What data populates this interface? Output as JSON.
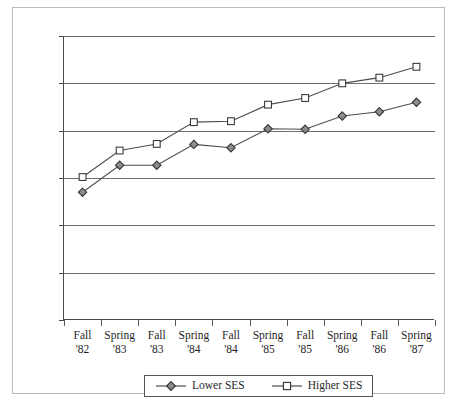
{
  "chart_data": {
    "type": "line",
    "title": "",
    "xlabel": "",
    "ylabel": "",
    "ylim": [
      0,
      600
    ],
    "yticks": [
      0,
      100,
      200,
      300,
      400,
      500,
      600
    ],
    "grid": true,
    "legend_position": "bottom-center",
    "categories": [
      "Fall '82",
      "Spring '83",
      "Fall '83",
      "Spring '84",
      "Fall '84",
      "Spring '85",
      "Fall '85",
      "Spring '86",
      "Fall '86",
      "Spring '87"
    ],
    "category_lines": [
      [
        "Fall",
        "'82"
      ],
      [
        "Spring",
        "'83"
      ],
      [
        "Fall",
        "'83"
      ],
      [
        "Spring",
        "'84"
      ],
      [
        "Fall",
        "'84"
      ],
      [
        "Spring",
        "'85"
      ],
      [
        "Fall",
        "'85"
      ],
      [
        "Spring",
        "'86"
      ],
      [
        "Fall",
        "'86"
      ],
      [
        "Spring",
        "'87"
      ]
    ],
    "series": [
      {
        "name": "Lower SES",
        "marker": "diamond-filled",
        "color": "#4d4d4d",
        "marker_fill": "#8c8c8c",
        "values": [
          270,
          327,
          327,
          371,
          364,
          404,
          403,
          431,
          440,
          460
        ]
      },
      {
        "name": "Higher SES",
        "marker": "square-open",
        "color": "#4d4d4d",
        "marker_fill": "#ffffff",
        "values": [
          302,
          358,
          372,
          418,
          420,
          455,
          469,
          500,
          512,
          535
        ]
      }
    ]
  },
  "axis": {
    "ytick_labels": [
      "600",
      "500",
      "400",
      "300",
      "200",
      "100",
      "0"
    ]
  },
  "legend": {
    "items": [
      {
        "label": "Lower SES"
      },
      {
        "label": "Higher SES"
      }
    ]
  }
}
